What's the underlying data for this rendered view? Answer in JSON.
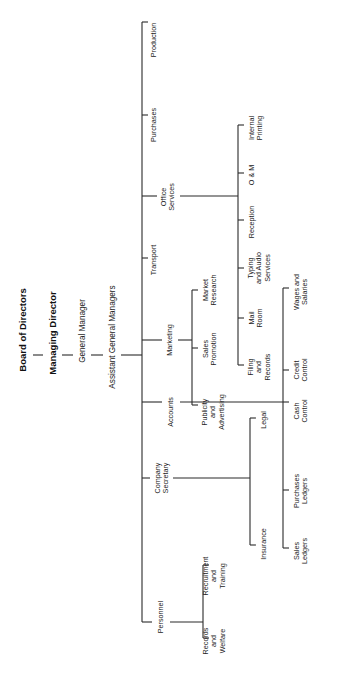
{
  "chart_title": "Organisation chart",
  "colors": {
    "line": "#2a2a2a",
    "text": "#222222",
    "background": "#ffffff"
  },
  "hierarchy": {
    "board": "Board of Directors",
    "managing_director": "Managing Director",
    "general_manager": "General Manager",
    "assistant_gms": "Assistant General Managers"
  },
  "departments": {
    "production": {
      "label": "Production"
    },
    "purchases": {
      "label": "Purchases"
    },
    "office_services": {
      "label": "Office\nServices",
      "children": {
        "internal_printing": "Internal\nPrinting",
        "om": "O & M",
        "reception": "Reception",
        "typing": "Typing\nand Audio\nServices",
        "mail_room": "Mail\nRoom",
        "filing": "Filing\nand\nRecords"
      }
    },
    "transport": {
      "label": "Transport"
    },
    "marketing": {
      "label": "Marketing",
      "children": {
        "market_research": "Market\nResearch",
        "sales_promotion": "Sales\nPromotion",
        "publicity": "Publicity\nand\nAdvertising"
      }
    },
    "accounts": {
      "label": "Accounts",
      "children": {
        "wages": "Wages and\nSalaries",
        "credit_control": "Credit\nControl",
        "cash_control": "Cash\nControl",
        "purchases_ledgers": "Purchases\nLedgers",
        "sales_ledgers": "Sales\nLedgers"
      }
    },
    "company_secretary": {
      "label": "Company\nSecretary",
      "children": {
        "legal": "Legal",
        "insurance": "Insurance"
      }
    },
    "personnel": {
      "label": "Personnel",
      "children": {
        "recruitment": "Recruitment\nand\nTraining",
        "records_welfare": "Records\nand\nWelfare"
      }
    }
  }
}
